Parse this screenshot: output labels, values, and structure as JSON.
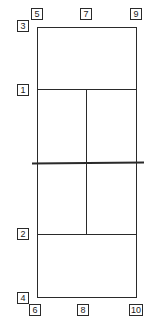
{
  "diagram": {
    "type": "tennis-court-plan",
    "colors": {
      "line": "#2a2a2a",
      "background": "#ffffff"
    },
    "labels": {
      "l1": "1",
      "l2": "2",
      "l3": "3",
      "l4": "4",
      "l5": "5",
      "l6": "6",
      "l7": "7",
      "l8": "8",
      "l9": "9",
      "l10": "10"
    }
  }
}
